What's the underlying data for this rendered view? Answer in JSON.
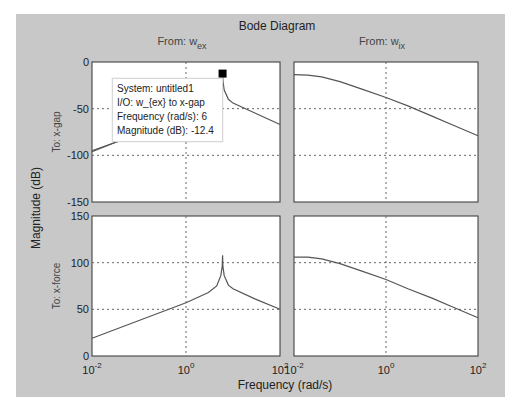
{
  "chart_data": {
    "type": "line",
    "title": "Bode Diagram",
    "xlabel": "Frequency  (rad/s)",
    "ylabel": "Magnitude (dB)",
    "xscale": "log",
    "grid": true,
    "columns": [
      {
        "label_prefix": "From: w",
        "label_sub": "ex"
      },
      {
        "label_prefix": "From: w",
        "label_sub": "ix"
      }
    ],
    "rows": [
      {
        "label": "To: x-gap",
        "ylim": [
          -150,
          0
        ],
        "yticks": [
          0,
          -50,
          -100,
          -150
        ]
      },
      {
        "label": "To: x-force",
        "ylim": [
          0,
          150
        ],
        "yticks": [
          150,
          100,
          50,
          0
        ]
      }
    ],
    "xticks": [
      {
        "base": "10",
        "exp": "-2",
        "value": 0.01
      },
      {
        "base": "10",
        "exp": "0",
        "value": 1
      },
      {
        "base": "10",
        "exp": "2",
        "value": 100
      }
    ],
    "xlim": [
      0.01,
      100
    ],
    "panels": [
      {
        "row": 0,
        "col": 0,
        "name": "w_ex to x-gap",
        "x": [
          0.01,
          0.1,
          1,
          3,
          4.5,
          5.5,
          5.9,
          6,
          6.1,
          6.5,
          8,
          10,
          30,
          100
        ],
        "y": [
          -96,
          -76,
          -56,
          -46,
          -40,
          -30,
          -20,
          -12.4,
          -20,
          -30,
          -40,
          -44,
          -55,
          -67
        ]
      },
      {
        "row": 0,
        "col": 1,
        "name": "w_ix to x-gap",
        "x": [
          0.01,
          0.02,
          0.04,
          0.1,
          0.3,
          1,
          3,
          10,
          30,
          100
        ],
        "y": [
          -13.5,
          -14,
          -16,
          -21,
          -29,
          -38,
          -47,
          -58,
          -68,
          -79
        ]
      },
      {
        "row": 1,
        "col": 0,
        "name": "w_ex to x-force",
        "x": [
          0.01,
          0.1,
          1,
          3,
          4.5,
          5.5,
          5.9,
          6,
          6.1,
          6.5,
          8,
          10,
          30,
          100
        ],
        "y": [
          19,
          38,
          57,
          68,
          75,
          86,
          96,
          108,
          96,
          86,
          76,
          72,
          61,
          50
        ]
      },
      {
        "row": 1,
        "col": 1,
        "name": "w_ix to x-force",
        "x": [
          0.01,
          0.02,
          0.04,
          0.1,
          0.3,
          1,
          3,
          10,
          30,
          100
        ],
        "y": [
          106,
          106,
          104,
          99,
          91,
          82,
          72,
          62,
          52,
          41
        ]
      }
    ],
    "datatip": {
      "lines": [
        "System: untitled1",
        "I/O: w_{ex} to x-gap",
        "Frequency (rad/s): 6",
        "Magnitude (dB): -12.4"
      ],
      "frequency": 6,
      "magnitude": -12.4
    }
  },
  "colors": {
    "figure_bg": "#c8c8c8",
    "axes_bg": "#ffffff",
    "line": "#555555",
    "grid": "#666666",
    "text": "#222222"
  }
}
